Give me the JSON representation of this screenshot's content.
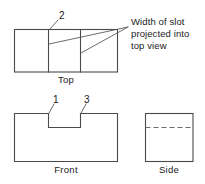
{
  "figure": {
    "background_color": "#ffffff",
    "line_color": "#4a4a4a",
    "hidden_line_color": "#6d6d6d",
    "leader_color": "#5a5a5a",
    "text_color": "#1a1a1a"
  },
  "views": {
    "top": {
      "caption": "Top",
      "callout": "2"
    },
    "front": {
      "caption": "Front",
      "callout_left": "1",
      "callout_right": "3"
    },
    "side": {
      "caption": "Side"
    }
  },
  "annotation": {
    "line1": "Width of slot",
    "line2": "projected into",
    "line3": "top view"
  }
}
